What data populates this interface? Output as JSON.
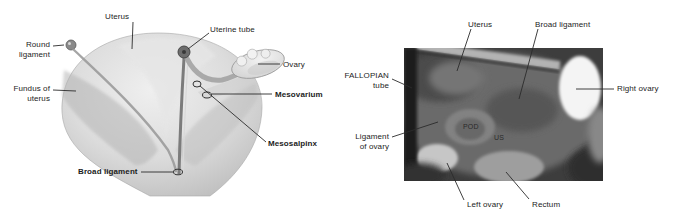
{
  "figure_type": "anatomical-diagram-and-laparoscopic-photo",
  "illustration": {
    "labels": {
      "uterus": "Uterus",
      "uterine_tube": "Uterine tube",
      "round_ligament": "Round ligament",
      "ovary": "Ovary",
      "fundus_of_uterus": "Fundus of uterus",
      "mesovarium": "Mesovarium",
      "mesosalpinx": "Mesosalpinx",
      "broad_ligament": "Broad ligament"
    }
  },
  "photo": {
    "labels": {
      "uterus": "Uterus",
      "broad_ligament": "Broad ligament",
      "fallopian_tube": "FALLOPIAN tube",
      "right_ovary": "Right ovary",
      "ligament_of_ovary": "Ligament of ovary",
      "left_ovary": "Left ovary",
      "rectum": "Rectum"
    },
    "inset_labels": {
      "pod": "POD",
      "us": "US"
    }
  },
  "colors": {
    "background": "#ffffff",
    "label_text": "#1c1c1c",
    "leader_line": "#2b2b2b",
    "illustration_light": "#eaeaea",
    "illustration_mid": "#c7c7c7",
    "illustration_dark": "#6d6d6d",
    "photo_base": "#636363",
    "photo_dark": "#1f1f1f",
    "photo_highlight": "#f4f4f4"
  }
}
